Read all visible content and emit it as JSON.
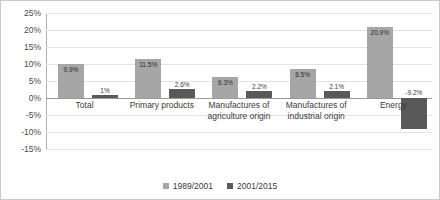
{
  "chart_data": {
    "type": "bar",
    "title": "",
    "xlabel": "",
    "ylabel": "",
    "ylim": [
      -15,
      25
    ],
    "ytick_step": 5,
    "grid": true,
    "legend_position": "bottom",
    "categories": [
      {
        "line1": "Total",
        "line2": ""
      },
      {
        "line1": "Primary products",
        "line2": ""
      },
      {
        "line1": "Manufactures of",
        "line2": "agriculture origin"
      },
      {
        "line1": "Manufactures of",
        "line2": "industrial origin"
      },
      {
        "line1": "Energy",
        "line2": ""
      }
    ],
    "ytick_labels": [
      "25%",
      "20%",
      "15%",
      "10%",
      "5%",
      "0%",
      "-5%",
      "-10%",
      "-15%"
    ],
    "ytick_values": [
      25,
      20,
      15,
      10,
      5,
      0,
      -5,
      -10,
      -15
    ],
    "series": [
      {
        "name": "1989/2001",
        "color": "#a6a6a6",
        "values": [
          9.9,
          11.5,
          6.3,
          8.5,
          20.9
        ],
        "labels": [
          "9.9%",
          "11.5%",
          "6.3%",
          "8.5%",
          "20.9%"
        ]
      },
      {
        "name": "2001/2015",
        "color": "#595959",
        "values": [
          1.0,
          2.6,
          2.2,
          2.1,
          -9.2
        ],
        "labels": [
          "1%",
          "2.6%",
          "2.2%",
          "2.1%",
          "-9.2%"
        ]
      }
    ]
  }
}
